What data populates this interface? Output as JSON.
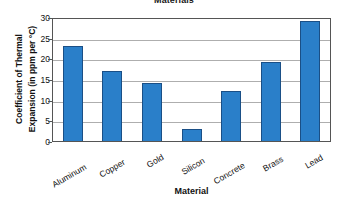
{
  "chart_data": {
    "type": "bar",
    "title": "Materials",
    "xlabel": "Material",
    "ylabel": "Coefficient of Thermal Expansion (in ppm per °C)",
    "ylabel_lines": [
      "Coefficient of Thermal",
      "Expansion (in ppm per °C)"
    ],
    "categories": [
      "Aluminum",
      "Copper",
      "Gold",
      "Silicon",
      "Concrete",
      "Brass",
      "Lead"
    ],
    "values": [
      23,
      17,
      14,
      3,
      12,
      19,
      29
    ],
    "ylim": [
      0,
      30
    ],
    "yticks": [
      0,
      5,
      10,
      15,
      20,
      25,
      30
    ],
    "ytick_labels": [
      "0",
      "5",
      "10",
      "15",
      "20",
      "25",
      "30"
    ],
    "grid": true,
    "legend": false,
    "bar_color": "#2a7fc9",
    "bar_border_color": "#1a4f86",
    "gridline_color": "#aeaeae",
    "axis_color": "#555555",
    "background_color": "#ffffff",
    "xtick_label_rotation": -30
  }
}
